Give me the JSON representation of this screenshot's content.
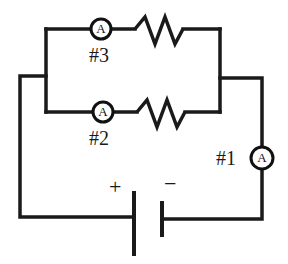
{
  "diagram": {
    "type": "circuit",
    "ammeters": [
      {
        "id": "1",
        "symbol": "A",
        "label": "#1",
        "position": "main line, right side"
      },
      {
        "id": "2",
        "symbol": "A",
        "label": "#2",
        "position": "lower parallel branch"
      },
      {
        "id": "3",
        "symbol": "A",
        "label": "#3",
        "position": "upper parallel branch"
      }
    ],
    "resistors": [
      {
        "branch": "upper"
      },
      {
        "branch": "lower"
      }
    ],
    "battery": {
      "positive_label": "+",
      "negative_label": "−"
    },
    "colors": {
      "line": "#1a1a1a",
      "background": "#ffffff"
    }
  }
}
